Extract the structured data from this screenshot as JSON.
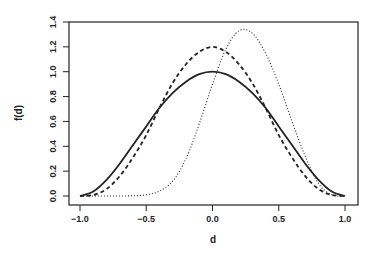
{
  "chart_data": {
    "type": "line",
    "title": "",
    "xlabel": "d",
    "ylabel": "f(d)",
    "xlim": [
      -1.0,
      1.0
    ],
    "ylim": [
      0.0,
      1.4
    ],
    "x_ticks": [
      "-1.0",
      "-0.5",
      "0.0",
      "0.5",
      "1.0"
    ],
    "y_ticks": [
      "0.0",
      "0.2",
      "0.4",
      "0.6",
      "0.8",
      "1.0",
      "1.2",
      "1.4"
    ],
    "grid": false,
    "legend": "none",
    "x": [
      -1.0,
      -0.9,
      -0.8,
      -0.7,
      -0.6,
      -0.5,
      -0.4,
      -0.3,
      -0.2,
      -0.1,
      0.0,
      0.1,
      0.2,
      0.3,
      0.4,
      0.5,
      0.6,
      0.7,
      0.8,
      0.9,
      1.0
    ],
    "series": [
      {
        "name": "solid",
        "style": "solid",
        "values": [
          0.0,
          0.036,
          0.13,
          0.26,
          0.41,
          0.56,
          0.71,
          0.83,
          0.92,
          0.98,
          1.0,
          0.98,
          0.92,
          0.83,
          0.71,
          0.56,
          0.41,
          0.26,
          0.13,
          0.036,
          0.0
        ]
      },
      {
        "name": "dashed",
        "style": "dashed",
        "values": [
          0.0,
          0.008,
          0.056,
          0.16,
          0.31,
          0.49,
          0.71,
          0.91,
          1.06,
          1.16,
          1.2,
          1.16,
          1.06,
          0.91,
          0.71,
          0.49,
          0.31,
          0.16,
          0.056,
          0.008,
          0.0
        ]
      },
      {
        "name": "dotted",
        "style": "dotted",
        "values": [
          0.0,
          0.0,
          0.0,
          0.0,
          0.002,
          0.01,
          0.04,
          0.12,
          0.3,
          0.58,
          0.9,
          1.18,
          1.33,
          1.31,
          1.15,
          0.9,
          0.6,
          0.32,
          0.1,
          0.01,
          0.0
        ]
      }
    ]
  }
}
